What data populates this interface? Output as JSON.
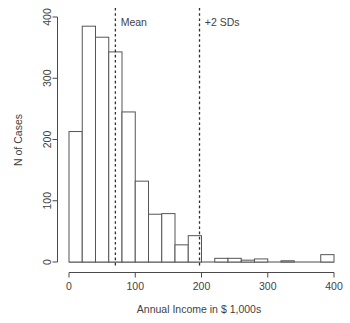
{
  "chart_data": {
    "type": "bar",
    "title": "",
    "subtitle": "",
    "xlabel": "Annual Income in $ 1,000s",
    "ylabel": "N of Cases",
    "xlim": [
      0,
      400
    ],
    "ylim": [
      0,
      400
    ],
    "grid": false,
    "legend": "none",
    "bin_width": 20,
    "x_ticks": [
      0,
      100,
      200,
      300,
      400
    ],
    "x_tick_labels": [
      "0",
      "100",
      "200",
      "300",
      "400"
    ],
    "y_ticks": [
      0,
      100,
      200,
      300,
      400
    ],
    "y_tick_labels": [
      "0",
      "100",
      "200",
      "300",
      "400"
    ],
    "categories": [
      "0-20",
      "20-40",
      "40-60",
      "60-80",
      "80-100",
      "100-120",
      "120-140",
      "140-160",
      "160-180",
      "180-200",
      "200-220",
      "220-240",
      "240-260",
      "260-280",
      "280-300",
      "300-320",
      "320-340",
      "340-360",
      "360-380",
      "380-400"
    ],
    "bin_starts": [
      0,
      20,
      40,
      60,
      80,
      100,
      120,
      140,
      160,
      180,
      200,
      220,
      240,
      260,
      280,
      300,
      320,
      340,
      360,
      380
    ],
    "values": [
      213,
      385,
      367,
      343,
      245,
      132,
      78,
      79,
      28,
      43,
      0,
      6,
      6,
      3,
      5,
      0,
      2,
      0,
      0,
      12
    ],
    "annotations": [
      {
        "name": "mean",
        "label": "Mean",
        "x": 70,
        "style": "dashed-vertical",
        "label_x": 78,
        "label_y": 385
      },
      {
        "name": "plus-2-sd",
        "label": "+2 SDs",
        "x": 197,
        "style": "dashed-vertical",
        "label_x": 205,
        "label_y": 385
      }
    ],
    "colors": {
      "bar_fill": "#ffffff",
      "bar_stroke": "#555555",
      "axis": "#4a4a4a",
      "text": "#3f3f3f",
      "reference_line": "#2f2f2f",
      "background": "#ffffff"
    }
  }
}
